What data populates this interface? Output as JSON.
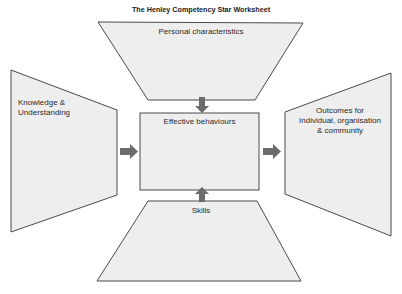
{
  "title": "The Henley Competency Star Worksheet",
  "colors": {
    "shape_fill": "#eeeeee",
    "shape_stroke": "#4a4a4a",
    "arrow_fill": "#6b6b6b",
    "text": "#2a2a2a",
    "background": "#ffffff"
  },
  "nodes": {
    "top": {
      "label": "Personal characteristics"
    },
    "left": {
      "label_line1": "Knowledge &",
      "label_line2": "Understanding"
    },
    "center": {
      "label": "Effective behaviours"
    },
    "right": {
      "label_line1": "Outcomes for",
      "label_line2": "Individual, organisation",
      "label_line3": "& community"
    },
    "bottom": {
      "label": "Skills"
    }
  },
  "arrows": [
    {
      "from": "top",
      "to": "center",
      "direction": "down"
    },
    {
      "from": "bottom",
      "to": "center",
      "direction": "up"
    },
    {
      "from": "left",
      "to": "center",
      "direction": "right"
    },
    {
      "from": "center",
      "to": "right",
      "direction": "right"
    }
  ]
}
